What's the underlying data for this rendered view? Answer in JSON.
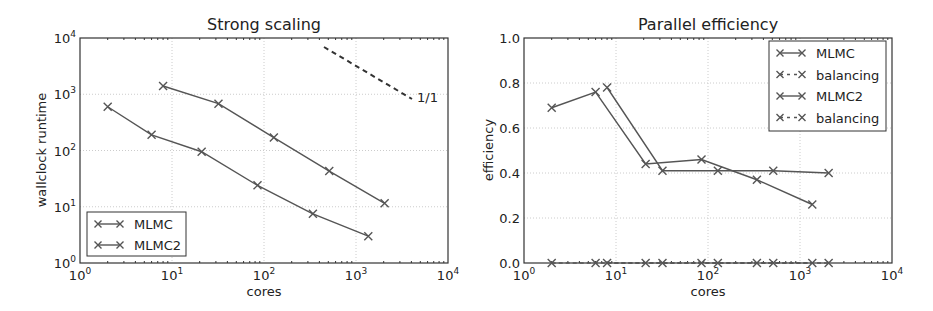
{
  "chart_data": [
    {
      "type": "line",
      "title": "Strong scaling",
      "xlabel": "cores",
      "ylabel": "wallclock runtime",
      "xscale": "log",
      "yscale": "log",
      "xlim": [
        1,
        10000
      ],
      "ylim": [
        1,
        10000
      ],
      "xticks": [
        "10^0",
        "10^1",
        "10^2",
        "10^3",
        "10^4"
      ],
      "yticks": [
        "10^0",
        "10^1",
        "10^2",
        "10^3",
        "10^4"
      ],
      "grid": true,
      "legend_position": "lower left",
      "series": [
        {
          "name": "MLMC",
          "style": "solid-x",
          "x": [
            2,
            6,
            21,
            85,
            340,
            1360
          ],
          "y": [
            600,
            190,
            95,
            24,
            7.5,
            3
          ]
        },
        {
          "name": "MLMC2",
          "style": "solid-x",
          "x": [
            8,
            32,
            128,
            512,
            2048
          ],
          "y": [
            1400,
            680,
            170,
            43,
            11.5
          ]
        }
      ],
      "annotations": [
        {
          "text": "1/1",
          "type": "reference-line",
          "style": "dashed",
          "x": [
            500,
            4000
          ],
          "y": [
            6000,
            800
          ]
        }
      ]
    },
    {
      "type": "line",
      "title": "Parallel efficiency",
      "xlabel": "cores",
      "ylabel": "efficiency",
      "xscale": "log",
      "yscale": "linear",
      "xlim": [
        1,
        10000
      ],
      "ylim": [
        0,
        1.0
      ],
      "xticks": [
        "10^0",
        "10^1",
        "10^2",
        "10^3",
        "10^4"
      ],
      "yticks": [
        "0.0",
        "0.2",
        "0.4",
        "0.6",
        "0.8",
        "1.0"
      ],
      "grid": true,
      "legend_position": "upper right",
      "series": [
        {
          "name": "MLMC",
          "style": "solid-x",
          "x": [
            2,
            6,
            21,
            85,
            340,
            1360
          ],
          "y": [
            0.69,
            0.76,
            0.44,
            0.46,
            0.37,
            0.26
          ]
        },
        {
          "name": "balancing",
          "style": "dashed-x",
          "x": [
            2,
            6,
            21,
            85,
            340,
            1360
          ],
          "y": [
            0,
            0,
            0,
            0,
            0,
            0
          ]
        },
        {
          "name": "MLMC2",
          "style": "solid-x",
          "x": [
            8,
            32,
            128,
            512,
            2048
          ],
          "y": [
            0.78,
            0.41,
            0.41,
            0.41,
            0.4
          ]
        },
        {
          "name": "balancing",
          "style": "dashed-x",
          "x": [
            8,
            32,
            128,
            512,
            2048
          ],
          "y": [
            0,
            0,
            0,
            0,
            0
          ]
        }
      ]
    }
  ],
  "left": {
    "title": "Strong scaling",
    "xlabel": "cores",
    "ylabel": "wallclock runtime",
    "annotation": "1/1",
    "legend": [
      "MLMC",
      "MLMC2"
    ]
  },
  "right": {
    "title": "Parallel efficiency",
    "xlabel": "cores",
    "ylabel": "efficiency",
    "legend": [
      "MLMC",
      "balancing",
      "MLMC2",
      "balancing"
    ],
    "yticks": [
      "0.0",
      "0.2",
      "0.4",
      "0.6",
      "0.8",
      "1.0"
    ]
  },
  "colors": {
    "line": "#555555",
    "axis": "#333333",
    "grid": "#cccccc"
  }
}
